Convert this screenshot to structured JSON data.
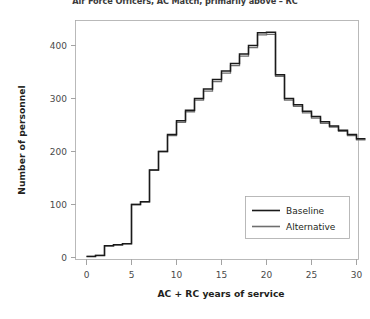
{
  "chart_data": {
    "type": "line",
    "title": "Air Force Officers, AC Match, primarily above – RC",
    "xlabel": "AC + RC years of service",
    "ylabel": "Number of personnel",
    "xlim": [
      -0.5,
      31.5
    ],
    "ylim": [
      -15,
      445
    ],
    "xticks": [
      0,
      5,
      10,
      15,
      20,
      25,
      30
    ],
    "xticklabels": [
      "0",
      "5",
      "10",
      "15",
      "20",
      "25",
      "30"
    ],
    "yticks": [
      0,
      100,
      200,
      300,
      400
    ],
    "yticklabels": [
      "0",
      "100",
      "200",
      "300",
      "400"
    ],
    "grid": false,
    "drawstyle": "steps-post",
    "legend_position": "lower right",
    "x": [
      0,
      1,
      2,
      3,
      4,
      5,
      6,
      7,
      8,
      9,
      10,
      11,
      12,
      13,
      14,
      15,
      16,
      17,
      18,
      19,
      20,
      21,
      22,
      23,
      24,
      25,
      26,
      27,
      28,
      29,
      30
    ],
    "series": [
      {
        "name": "Baseline",
        "color": "#1a1a1a",
        "values": [
          2,
          4,
          22,
          24,
          26,
          100,
          105,
          165,
          200,
          232,
          258,
          278,
          300,
          318,
          336,
          352,
          366,
          384,
          400,
          424,
          425,
          345,
          300,
          288,
          276,
          266,
          256,
          248,
          240,
          232,
          224
        ]
      },
      {
        "name": "Alternative",
        "color": "#6e6e6e",
        "values": [
          2,
          4,
          22,
          24,
          26,
          100,
          105,
          165,
          200,
          230,
          255,
          275,
          297,
          314,
          332,
          348,
          362,
          380,
          396,
          420,
          421,
          342,
          297,
          285,
          273,
          263,
          253,
          246,
          238,
          230,
          222
        ]
      }
    ]
  },
  "legend": {
    "entries": [
      {
        "label": "Baseline"
      },
      {
        "label": "Alternative"
      }
    ]
  }
}
